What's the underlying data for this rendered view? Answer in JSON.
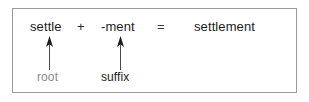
{
  "figure": {
    "kind": "word-formation-diagram",
    "border_color": "#9a9a9a",
    "background_color": "#ffffff"
  },
  "equation": {
    "root_word": "settle",
    "plus_sign": "+",
    "suffix_word": "-ment",
    "equals_sign": "=",
    "result_word": "settlement",
    "text_color": "#1c1c1c"
  },
  "annotations": {
    "root": {
      "label": "root",
      "color": "#8c8c8c",
      "arrow_icon": "arrow-up-icon",
      "points_to": "settle"
    },
    "suffix": {
      "label": "suffix",
      "color": "#1c1c1c",
      "arrow_icon": "arrow-up-icon",
      "points_to": "-ment"
    }
  }
}
